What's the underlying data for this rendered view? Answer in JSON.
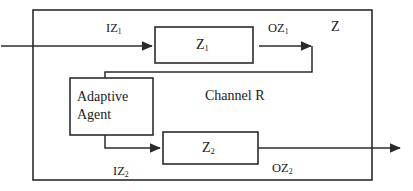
{
  "diagram": {
    "title_label": "Z",
    "channel_label": "Channel R",
    "outer_box": {
      "name": "Z"
    },
    "blocks": [
      {
        "id": "z1",
        "label": "Z",
        "sub": "1"
      },
      {
        "id": "z2",
        "label": "Z",
        "sub": "2"
      },
      {
        "id": "agent",
        "line1": "Adaptive",
        "line2": "Agent"
      }
    ],
    "signals": [
      {
        "id": "iz1",
        "label": "IZ",
        "sub": "1"
      },
      {
        "id": "oz1",
        "label": "OZ",
        "sub": "1"
      },
      {
        "id": "iz2",
        "label": "IZ",
        "sub": "2"
      },
      {
        "id": "oz2",
        "label": "OZ",
        "sub": "2"
      }
    ],
    "colors": {
      "stroke": "#2b2b2b",
      "text": "#1a1a1a",
      "background": "#ffffff"
    }
  }
}
